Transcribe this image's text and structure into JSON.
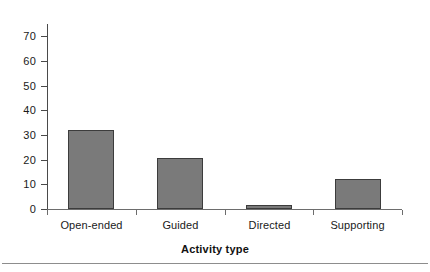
{
  "chart_data": {
    "type": "bar",
    "title": "",
    "subtitle": "",
    "categories": [
      "Open-ended",
      "Guided",
      "Directed",
      "Supporting"
    ],
    "values": [
      32,
      20.5,
      1.5,
      12
    ],
    "xlabel": "Activity type",
    "ylabel": "",
    "ylim": [
      0,
      75
    ],
    "y_ticks": [
      0,
      10,
      20,
      30,
      40,
      50,
      60,
      70
    ],
    "y_tick_labels": [
      "0",
      "10",
      "20",
      "30",
      "40",
      "50",
      "60",
      "70"
    ],
    "grid": false,
    "legend": false,
    "legend_position": "none",
    "bar_fill_color": "#7a7a7a",
    "bar_edge_color": "#3c3c3c",
    "axis_color": "#4a4a4a",
    "background_color": "#ffffff"
  },
  "axes": {
    "y_axis_name": "value-axis",
    "x_axis_name": "category-axis"
  },
  "footer": {
    "rule_color": "#8d8d8d"
  }
}
